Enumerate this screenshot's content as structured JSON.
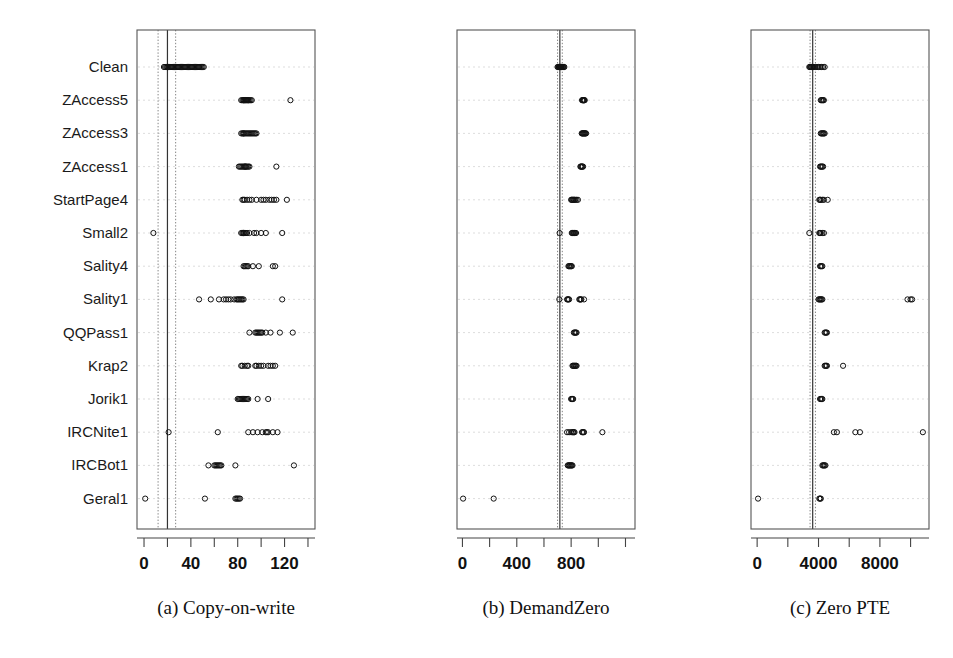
{
  "figure": {
    "title": "",
    "background": "#ffffff",
    "point_color": "#111111",
    "grid_color": "#d9d9d9",
    "frame_color": "#555555"
  },
  "row_labels": [
    "Clean",
    "ZAccess5",
    "ZAccess3",
    "ZAccess1",
    "StartPage4",
    "Small2",
    "Sality4",
    "Sality1",
    "QQPass1",
    "Krap2",
    "Jorik1",
    "IRCNite1",
    "IRCBot1",
    "Geral1"
  ],
  "captions": [
    "(a) Copy-on-write",
    "(b) DemandZero",
    "(c) Zero PTE"
  ],
  "chart_data": [
    {
      "type": "scatter",
      "title": "(a) Copy-on-write",
      "xlabel": "",
      "ylabel": "",
      "xlim": [
        -6,
        146
      ],
      "grid": true,
      "legend": "none",
      "tick_values": [
        0,
        20,
        40,
        60,
        80,
        100,
        120,
        140
      ],
      "tick_labels": [
        "0",
        "",
        "40",
        "",
        "80",
        "",
        "120",
        ""
      ],
      "reference_lines": [
        {
          "value": 12,
          "style": "dotted"
        },
        {
          "value": 20,
          "style": "solid"
        },
        {
          "value": 27,
          "style": "dotted"
        }
      ],
      "categories": [
        "Clean",
        "ZAccess5",
        "ZAccess3",
        "ZAccess1",
        "StartPage4",
        "Small2",
        "Sality4",
        "Sality1",
        "QQPass1",
        "Krap2",
        "Jorik1",
        "IRCNite1",
        "IRCBot1",
        "Geral1"
      ],
      "series": [
        {
          "name": "Clean",
          "values": [
            17,
            18,
            19,
            20,
            20,
            21,
            22,
            23,
            24,
            25,
            26,
            27,
            28,
            29,
            30,
            31,
            32,
            33,
            34,
            35,
            36,
            37,
            38,
            39,
            40,
            41,
            42,
            43,
            44,
            45,
            46,
            47,
            48,
            49,
            50,
            51
          ]
        },
        {
          "name": "ZAccess5",
          "values": [
            83,
            84,
            85,
            85,
            86,
            86,
            87,
            87,
            88,
            88,
            89,
            89,
            90,
            91,
            92,
            125
          ]
        },
        {
          "name": "ZAccess3",
          "values": [
            83,
            84,
            85,
            85,
            86,
            87,
            88,
            89,
            90,
            91,
            92,
            93,
            94,
            95,
            96
          ]
        },
        {
          "name": "ZAccess1",
          "values": [
            81,
            82,
            83,
            84,
            85,
            86,
            86,
            87,
            87,
            88,
            89,
            90,
            113
          ]
        },
        {
          "name": "StartPage4",
          "values": [
            84,
            85,
            86,
            88,
            90,
            92,
            96,
            100,
            102,
            104,
            107,
            109,
            111,
            113,
            122
          ]
        },
        {
          "name": "Small2",
          "values": [
            8,
            83,
            84,
            85,
            85,
            86,
            87,
            88,
            90,
            94,
            96,
            100,
            104,
            118
          ]
        },
        {
          "name": "Sality4",
          "values": [
            85,
            86,
            87,
            88,
            89,
            93,
            98,
            110,
            112
          ]
        },
        {
          "name": "Sality1",
          "values": [
            47,
            57,
            64,
            68,
            70,
            72,
            74,
            77,
            79,
            80,
            81,
            82,
            83,
            84,
            85,
            118
          ]
        },
        {
          "name": "QQPass1",
          "values": [
            90,
            95,
            96,
            97,
            98,
            99,
            100,
            101,
            104,
            108,
            116,
            127
          ]
        },
        {
          "name": "Krap2",
          "values": [
            83,
            84,
            86,
            88,
            89,
            95,
            96,
            98,
            100,
            102,
            106,
            108,
            110,
            112
          ]
        },
        {
          "name": "Jorik1",
          "values": [
            80,
            81,
            82,
            83,
            84,
            85,
            86,
            87,
            88,
            89,
            97,
            106
          ]
        },
        {
          "name": "IRCNite1",
          "values": [
            21,
            63,
            89,
            93,
            97,
            101,
            104,
            105,
            106,
            110,
            114
          ]
        },
        {
          "name": "IRCBot1",
          "values": [
            55,
            60,
            61,
            62,
            63,
            64,
            65,
            66,
            78,
            128
          ]
        },
        {
          "name": "Geral1",
          "values": [
            1,
            52,
            78,
            79,
            80,
            81,
            82
          ]
        }
      ]
    },
    {
      "type": "scatter",
      "title": "(b) DemandZero",
      "xlabel": "",
      "ylabel": "",
      "xlim": [
        -40,
        1270
      ],
      "grid": true,
      "legend": "none",
      "tick_values": [
        0,
        200,
        400,
        600,
        800,
        1000,
        1200
      ],
      "tick_labels": [
        "0",
        "",
        "400",
        "",
        "800",
        "",
        ""
      ],
      "reference_lines": [
        {
          "value": 700,
          "style": "dotted"
        },
        {
          "value": 717,
          "style": "solid"
        },
        {
          "value": 735,
          "style": "dotted"
        }
      ],
      "categories": [
        "Clean",
        "ZAccess5",
        "ZAccess3",
        "ZAccess1",
        "StartPage4",
        "Small2",
        "Sality4",
        "Sality1",
        "QQPass1",
        "Krap2",
        "Jorik1",
        "IRCNite1",
        "IRCBot1",
        "Geral1"
      ],
      "series": [
        {
          "name": "Clean",
          "values": [
            700,
            705,
            710,
            712,
            715,
            717,
            718,
            720,
            722,
            725,
            728,
            730,
            735,
            740,
            745,
            750
          ]
        },
        {
          "name": "ZAccess5",
          "values": [
            880,
            885,
            888,
            890,
            893,
            896,
            900
          ]
        },
        {
          "name": "ZAccess3",
          "values": [
            878,
            882,
            886,
            890,
            894,
            898,
            902,
            906,
            910
          ]
        },
        {
          "name": "ZAccess1",
          "values": [
            868,
            872,
            876,
            880,
            884,
            888
          ]
        },
        {
          "name": "StartPage4",
          "values": [
            800,
            805,
            810,
            815,
            820,
            825,
            830,
            840,
            850
          ]
        },
        {
          "name": "Small2",
          "values": [
            715,
            805,
            810,
            815,
            820,
            825,
            830,
            836
          ]
        },
        {
          "name": "Sality4",
          "values": [
            780,
            785,
            790,
            795,
            800,
            805
          ]
        },
        {
          "name": "Sality1",
          "values": [
            713,
            770,
            775,
            780,
            785,
            860,
            865,
            870,
            875,
            895
          ]
        },
        {
          "name": "QQPass1",
          "values": [
            820,
            825,
            830,
            835,
            840
          ]
        },
        {
          "name": "Krap2",
          "values": [
            810,
            815,
            820,
            825,
            830,
            835,
            840
          ]
        },
        {
          "name": "Jorik1",
          "values": [
            800,
            805,
            810,
            815
          ]
        },
        {
          "name": "IRCNite1",
          "values": [
            770,
            785,
            800,
            810,
            815,
            820,
            825,
            880,
            885,
            890,
            895,
            1030
          ]
        },
        {
          "name": "IRCBot1",
          "values": [
            775,
            780,
            785,
            790,
            795,
            800,
            805,
            810
          ]
        },
        {
          "name": "Geral1",
          "values": [
            5,
            230
          ]
        }
      ]
    },
    {
      "type": "scatter",
      "title": "(c) Zero PTE",
      "xlabel": "",
      "ylabel": "",
      "xlim": [
        -400,
        11200
      ],
      "grid": true,
      "legend": "none",
      "tick_values": [
        0,
        2000,
        4000,
        6000,
        8000,
        10000
      ],
      "tick_labels": [
        "0",
        "",
        "4000",
        "",
        "8000",
        ""
      ],
      "reference_lines": [
        {
          "value": 3450,
          "style": "dotted"
        },
        {
          "value": 3620,
          "style": "solid"
        },
        {
          "value": 3800,
          "style": "dotted"
        }
      ],
      "categories": [
        "Clean",
        "ZAccess5",
        "ZAccess3",
        "ZAccess1",
        "StartPage4",
        "Small2",
        "Sality4",
        "Sality1",
        "QQPass1",
        "Krap2",
        "Jorik1",
        "IRCNite1",
        "IRCBot1",
        "Geral1"
      ],
      "series": [
        {
          "name": "Clean",
          "values": [
            3400,
            3450,
            3500,
            3550,
            3600,
            3650,
            3700,
            3800,
            3900,
            4000,
            4100,
            4200,
            4300,
            4400
          ]
        },
        {
          "name": "ZAccess5",
          "values": [
            4150,
            4200,
            4250,
            4300,
            4350
          ]
        },
        {
          "name": "ZAccess3",
          "values": [
            4150,
            4200,
            4250,
            4300,
            4350,
            4400
          ]
        },
        {
          "name": "ZAccess1",
          "values": [
            4100,
            4150,
            4200,
            4250,
            4300
          ]
        },
        {
          "name": "StartPage4",
          "values": [
            4050,
            4100,
            4150,
            4250,
            4350,
            4600
          ]
        },
        {
          "name": "Small2",
          "values": [
            3400,
            4050,
            4100,
            4150,
            4250,
            4350
          ]
        },
        {
          "name": "Sality4",
          "values": [
            4100,
            4150,
            4200,
            4250
          ]
        },
        {
          "name": "Sality1",
          "values": [
            4000,
            4050,
            4100,
            4150,
            4200,
            4250,
            9800,
            10000,
            10100
          ]
        },
        {
          "name": "QQPass1",
          "values": [
            4400,
            4450,
            4500,
            4550
          ]
        },
        {
          "name": "Krap2",
          "values": [
            4400,
            4450,
            4500,
            4550,
            5600
          ]
        },
        {
          "name": "Jorik1",
          "values": [
            4100,
            4150,
            4200,
            4250
          ]
        },
        {
          "name": "IRCNite1",
          "values": [
            5000,
            5200,
            6400,
            6700,
            10800
          ]
        },
        {
          "name": "IRCBot1",
          "values": [
            4250,
            4300,
            4350,
            4400,
            4450
          ]
        },
        {
          "name": "Geral1",
          "values": [
            60,
            4050,
            4100,
            4150
          ]
        }
      ]
    }
  ]
}
